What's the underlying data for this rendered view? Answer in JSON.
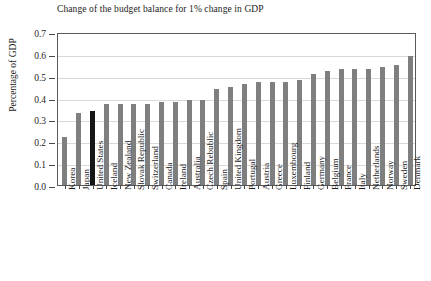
{
  "chart_data": {
    "type": "bar",
    "title": "Change of the budget balance for 1% change in GDP",
    "xlabel": "",
    "ylabel": "Percentage of GDP",
    "ylim": [
      0.0,
      0.7
    ],
    "yticks": [
      "0.0",
      "0.1",
      "0.2",
      "0.3",
      "0.4",
      "0.5",
      "0.6",
      "0.7"
    ],
    "grid": true,
    "legend": "none",
    "highlight_category": "United States",
    "bar_color": "#7f7f7f",
    "highlight_color": "#161616",
    "categories": [
      "Korea",
      "Japan",
      "United States",
      "Iceland",
      "New Zealand",
      "Slovak Republic",
      "Switzerland",
      "Canada",
      "Ireland",
      "Australia",
      "Czech Rebublic",
      "Spain",
      "United Kingdom",
      "Portugal",
      "Austria",
      "Greece",
      "Luxembourg",
      "Finland",
      "Germany",
      "Belgium",
      "France",
      "Italy",
      "Netherlands",
      "Norway",
      "Sweden",
      "Denmark"
    ],
    "values": [
      0.22,
      0.33,
      0.34,
      0.37,
      0.37,
      0.37,
      0.37,
      0.38,
      0.38,
      0.39,
      0.39,
      0.44,
      0.45,
      0.46,
      0.47,
      0.47,
      0.47,
      0.48,
      0.51,
      0.52,
      0.53,
      0.53,
      0.53,
      0.54,
      0.55,
      0.59
    ]
  }
}
